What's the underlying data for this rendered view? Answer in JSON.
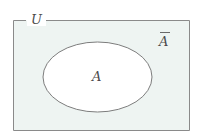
{
  "diagram": {
    "type": "venn-set-diagram",
    "universe": {
      "label": "U",
      "shape": "rectangle",
      "fill_color": "#eef4f2",
      "stroke_color": "#8a8a8a",
      "x": 13,
      "y": 20,
      "width": 177,
      "height": 111
    },
    "set": {
      "label": "A",
      "shape": "ellipse",
      "fill_color": "#ffffff",
      "stroke_color": "#7d7d7d",
      "cx": 97,
      "cy": 77,
      "rx": 55,
      "ry": 35
    },
    "complement": {
      "label": "A",
      "overbar": true,
      "label_full": "Ā",
      "region": "inside-rectangle-outside-ellipse",
      "x": 165,
      "y": 42
    },
    "colors": {
      "page_background": "#ffffff",
      "universe_fill": "#eef4f2",
      "set_fill": "#ffffff",
      "stroke": "#8a8a8a",
      "text": "#4a4a4a"
    }
  }
}
